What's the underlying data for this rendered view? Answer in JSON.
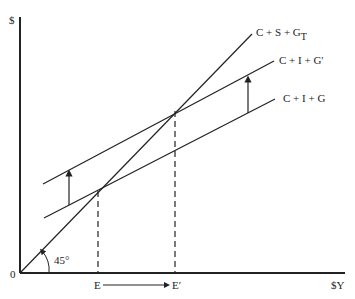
{
  "diagram": {
    "y_axis_label": "$",
    "x_axis_label": "$Y",
    "origin_label": "0",
    "angle_label": "45°",
    "lines": [
      {
        "name": "C + S + G_T",
        "label_main": "C + S + G",
        "label_sub": "T"
      },
      {
        "name": "C + I + G'",
        "label_main": "C + I + G′"
      },
      {
        "name": "C + I + G",
        "label_main": "C + I + G"
      }
    ],
    "equilibria": [
      {
        "label": "E"
      },
      {
        "label": "E′"
      }
    ],
    "colors": {
      "ink": "#222222",
      "background": "#ffffff"
    }
  }
}
